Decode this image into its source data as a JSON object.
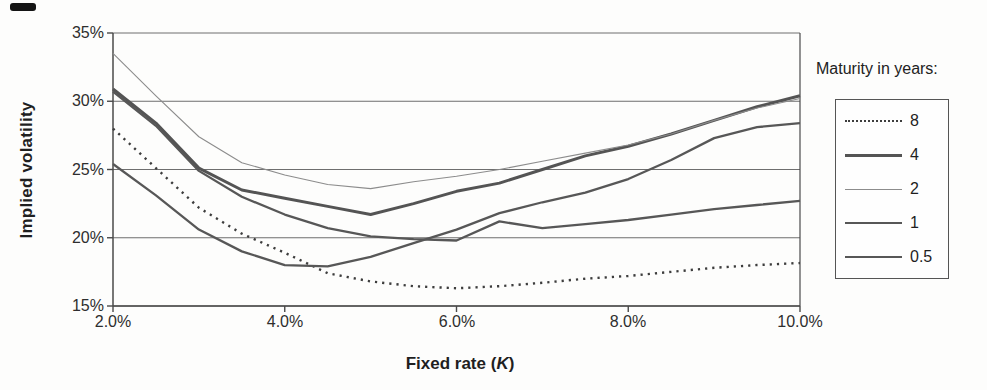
{
  "chart_data": {
    "type": "line",
    "title": "",
    "xlabel": "Fixed rate (K)",
    "xlabel_parts": {
      "prefix": "Fixed rate (",
      "k": "K",
      "suffix": ")"
    },
    "ylabel": "Implied volatility",
    "xlim": [
      2,
      10
    ],
    "ylim": [
      15,
      35
    ],
    "grid": "horizontal",
    "x_ticks": [
      "2.0%",
      "4.0%",
      "6.0%",
      "8.0%",
      "10.0%"
    ],
    "y_ticks": [
      "35%",
      "30%",
      "25%",
      "20%",
      "15%"
    ],
    "legend_title": "Maturity in years:",
    "legend_position": "right",
    "axis_color": "#4a4a4a",
    "grid_color": "#6e6e6e",
    "x": [
      2,
      2.5,
      3,
      3.5,
      4,
      4.5,
      5,
      5.5,
      6,
      6.5,
      7,
      7.5,
      8,
      8.5,
      9,
      9.5,
      10
    ],
    "series": [
      {
        "name": "8",
        "style": "dotted",
        "width": 2.4,
        "color": "#3d3d3d",
        "values": [
          28.0,
          25.1,
          22.2,
          20.3,
          18.9,
          17.4,
          16.8,
          16.45,
          16.3,
          16.45,
          16.7,
          17.0,
          17.2,
          17.5,
          17.8,
          18.0,
          18.15
        ]
      },
      {
        "name": "4",
        "style": "solid",
        "width": 3.0,
        "color": "#545454",
        "values": [
          30.9,
          28.4,
          25.1,
          23.5,
          22.9,
          22.3,
          21.7,
          22.5,
          23.4,
          24.0,
          25.0,
          26.0,
          26.7,
          27.6,
          28.6,
          29.6,
          30.4
        ]
      },
      {
        "name": "2",
        "style": "solid",
        "width": 1.1,
        "color": "#8c8c8c",
        "values": [
          33.5,
          30.4,
          27.4,
          25.5,
          24.6,
          23.9,
          23.6,
          24.1,
          24.5,
          25.0,
          25.6,
          26.2,
          26.8,
          27.6,
          28.6,
          29.5,
          30.2
        ]
      },
      {
        "name": "1",
        "style": "solid",
        "width": 2.3,
        "color": "#575757",
        "values": [
          30.7,
          28.2,
          24.9,
          23.0,
          21.7,
          20.7,
          20.1,
          19.9,
          19.8,
          21.2,
          20.7,
          21.0,
          21.3,
          21.7,
          22.1,
          22.4,
          22.7
        ]
      },
      {
        "name": "0.5",
        "style": "solid",
        "width": 2.3,
        "color": "#575757",
        "values": [
          25.4,
          23.1,
          20.6,
          19.0,
          18.0,
          17.9,
          18.6,
          19.6,
          20.6,
          21.8,
          22.6,
          23.3,
          24.3,
          25.7,
          27.3,
          28.1,
          28.4
        ]
      }
    ]
  }
}
